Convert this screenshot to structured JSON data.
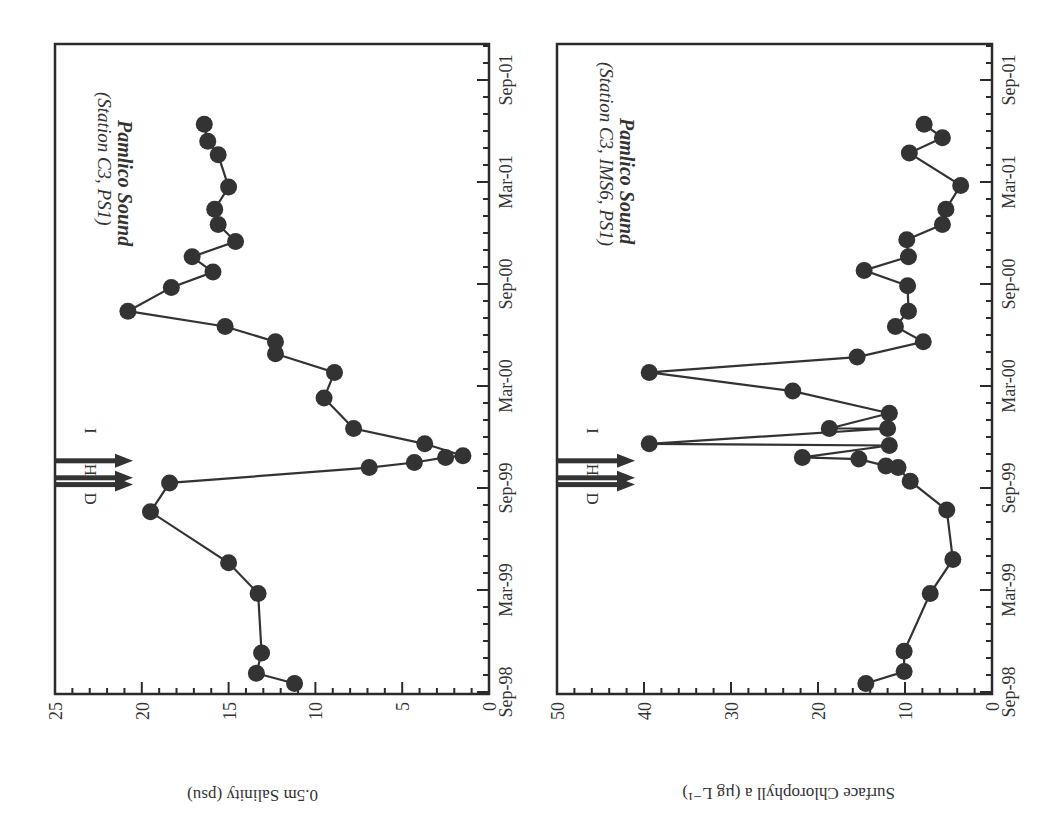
{
  "figure": {
    "orientation_note": "rotated 90 degrees clockwise",
    "colors": {
      "ink": "#333333",
      "background": "#ffffff"
    }
  },
  "chart_data": [
    {
      "type": "line",
      "id": "salinity",
      "title": "Pamlico Sound",
      "subtitle": "(Station C3, PS1)",
      "xlabel": "",
      "ylabel": "0.5m Salinity (psu)",
      "ylim": [
        0,
        25
      ],
      "yticks": [
        "0",
        "5",
        "10",
        "15",
        "20",
        "25"
      ],
      "xtick_labels": [
        "Sep-98",
        "Mar-99",
        "Sep-99",
        "Mar-00",
        "Sep-00",
        "Mar-01",
        "Sep-01"
      ],
      "x_unit": "months since Sep-98",
      "annotations": [
        {
          "label": "D",
          "x": 12.2
        },
        {
          "label": "H",
          "x": 12.6
        },
        {
          "label": "I",
          "x": 13.6
        }
      ],
      "x": [
        0.5,
        1.1,
        2.3,
        5.8,
        7.6,
        10.6,
        12.3,
        13.2,
        13.5,
        13.8,
        13.9,
        14.6,
        15.5,
        17.3,
        18.8,
        19.9,
        20.6,
        21.5,
        22.4,
        23.8,
        24.7,
        25.6,
        26.5,
        27.5,
        28.4,
        29.7,
        31.6,
        32.4,
        33.4
      ],
      "values": [
        11.2,
        13.4,
        13.1,
        13.3,
        15.0,
        19.5,
        18.4,
        6.9,
        4.3,
        2.5,
        1.5,
        3.7,
        7.8,
        9.5,
        8.9,
        12.3,
        12.3,
        15.2,
        20.8,
        18.3,
        15.9,
        17.1,
        14.6,
        15.6,
        15.8,
        15.0,
        15.6,
        16.2,
        16.4
      ]
    },
    {
      "type": "line",
      "id": "chlorophyll",
      "title": "Pamlico Sound",
      "subtitle": "(Station C3, IMS6, PS1)",
      "xlabel": "",
      "ylabel": "Surface Chlorophyll a (µg L⁻¹)",
      "ylim": [
        0,
        50
      ],
      "yticks": [
        "0",
        "10",
        "20",
        "30",
        "40",
        "50"
      ],
      "xtick_labels": [
        "Sep-98",
        "Mar-99",
        "Sep-99",
        "Mar-00",
        "Sep-00",
        "Mar-01",
        "Sep-01"
      ],
      "x_unit": "months since Sep-98",
      "annotations": [
        {
          "label": "D",
          "x": 12.2
        },
        {
          "label": "H",
          "x": 12.6
        },
        {
          "label": "I",
          "x": 13.6
        }
      ],
      "x": [
        0.5,
        1.2,
        2.4,
        5.8,
        7.8,
        10.7,
        12.4,
        13.2,
        13.3,
        13.7,
        13.8,
        14.5,
        14.6,
        15.5,
        15.5,
        16.4,
        17.7,
        18.8,
        19.7,
        20.6,
        21.5,
        22.4,
        23.9,
        24.8,
        25.6,
        26.6,
        27.5,
        28.4,
        29.8,
        31.7,
        32.6,
        33.4
      ],
      "values": [
        14.5,
        10.1,
        10.1,
        7.1,
        4.5,
        5.2,
        9.4,
        10.8,
        12.2,
        15.3,
        21.8,
        11.8,
        39.4,
        12.0,
        18.7,
        11.8,
        22.9,
        39.4,
        15.5,
        7.9,
        11.1,
        9.6,
        9.7,
        14.7,
        9.6,
        9.8,
        5.7,
        5.3,
        3.6,
        9.5,
        5.7,
        7.8
      ]
    }
  ],
  "panels": {
    "salinity": {
      "title": "Pamlico Sound",
      "subtitle": "(Station C3, PS1)",
      "axis_title": "0.5m Salinity (psu)",
      "value_ticks": [
        "25",
        "20",
        "15",
        "10",
        "5",
        "0"
      ],
      "date_ticks": [
        "Sep-01",
        "Mar-01",
        "Sep-00",
        "Mar-00",
        "Sep-99",
        "Mar-99",
        "Sep-98"
      ],
      "event_labels": [
        "D",
        "H",
        "I"
      ]
    },
    "chlorophyll": {
      "title": "Pamlico Sound",
      "subtitle": "(Station C3, IMS6, PS1)",
      "axis_title": "Surface Chlorophyll a (µg L⁻¹)",
      "value_ticks": [
        "50",
        "40",
        "30",
        "20",
        "10",
        "0"
      ],
      "date_ticks": [
        "Sep-01",
        "Mar-01",
        "Sep-00",
        "Mar-00",
        "Sep-99",
        "Mar-99",
        "Sep-98"
      ],
      "event_labels": [
        "D",
        "H",
        "I"
      ]
    }
  }
}
